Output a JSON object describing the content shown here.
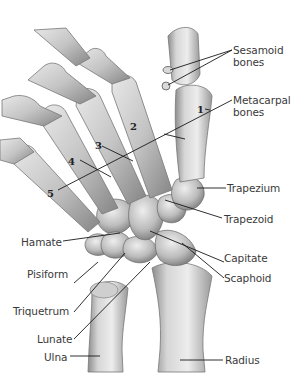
{
  "figure": {
    "labels": {
      "sesamoid_1": "Sesamoid",
      "sesamoid_2": "bones",
      "metacarpal_1": "Metacarpal",
      "metacarpal_2": "bones",
      "trapezium": "Trapezium",
      "trapezoid": "Trapezoid",
      "capitate": "Capitate",
      "scaphoid": "Scaphoid",
      "radius": "Radius",
      "hamate": "Hamate",
      "pisiform": "Pisiform",
      "triquetrum": "Triquetrum",
      "lunate": "Lunate",
      "ulna": "Ulna"
    },
    "metacarpal_numbers": [
      "1",
      "2",
      "3",
      "4",
      "5"
    ],
    "colors": {
      "bone_light": "#e9e9e9",
      "bone_mid": "#bdbdbd",
      "bone_dark": "#7a7a7a",
      "leader_line": "#1a1a1a",
      "label_text": "#3a3a3a"
    }
  }
}
